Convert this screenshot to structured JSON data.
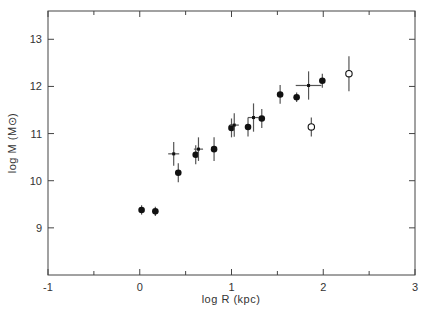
{
  "chart_data": {
    "type": "scatter",
    "title": "",
    "xlabel": "log R (kpc)",
    "ylabel": "log M (M⊙)",
    "ylabel_main": "log M",
    "ylabel_unit": "(M⊙)",
    "xlim": [
      -1,
      3
    ],
    "ylim": [
      8,
      13.6
    ],
    "x_ticks": [
      -1,
      0,
      1,
      2,
      3
    ],
    "x_tick_labels": [
      "-1",
      "0",
      "1",
      "2",
      "3"
    ],
    "x_minor_ticks": [
      -0.5,
      0.5,
      1.5,
      2.5
    ],
    "y_ticks": [
      9,
      10,
      11,
      12,
      13
    ],
    "y_tick_labels": [
      "9",
      "10",
      "11",
      "12",
      "13"
    ],
    "grid": false,
    "legend": null,
    "series": [
      {
        "name": "filled circles",
        "marker": "filled-circle",
        "points": [
          {
            "x": 0.02,
            "y": 9.38,
            "yerr": 0.1
          },
          {
            "x": 0.17,
            "y": 9.35,
            "yerr": 0.1
          },
          {
            "x": 0.42,
            "y": 10.17,
            "yerr": 0.2
          },
          {
            "x": 0.61,
            "y": 10.55,
            "yerr": 0.2
          },
          {
            "x": 0.81,
            "y": 10.67,
            "yerr": 0.25
          },
          {
            "x": 1.0,
            "y": 11.12,
            "yerr": 0.2
          },
          {
            "x": 1.18,
            "y": 11.14,
            "yerr": 0.2
          },
          {
            "x": 1.33,
            "y": 11.32,
            "yerr": 0.2
          },
          {
            "x": 1.53,
            "y": 11.83,
            "yerr": 0.2
          },
          {
            "x": 1.71,
            "y": 11.77,
            "yerr": 0.1
          },
          {
            "x": 1.99,
            "y": 12.12,
            "yerr": 0.15
          }
        ]
      },
      {
        "name": "crosses",
        "marker": "cross",
        "points": [
          {
            "x": 0.37,
            "y": 10.57,
            "yerr": 0.25,
            "xerr": 0.06
          },
          {
            "x": 0.64,
            "y": 10.67,
            "yerr": 0.25,
            "xerr": 0.05
          },
          {
            "x": 1.03,
            "y": 11.18,
            "yerr": 0.25,
            "xerr": 0.05
          },
          {
            "x": 1.24,
            "y": 11.34,
            "yerr": 0.3,
            "xerr": 0.06
          },
          {
            "x": 1.84,
            "y": 12.02,
            "yerr": 0.3,
            "xerr": 0.14
          }
        ]
      },
      {
        "name": "open circles",
        "marker": "open-circle",
        "points": [
          {
            "x": 1.87,
            "y": 11.14,
            "yerr": 0.2
          },
          {
            "x": 2.28,
            "y": 12.27,
            "yerr": 0.37
          }
        ]
      }
    ]
  },
  "colors": {
    "axis": "#444444",
    "marker": "#111111",
    "errorbar": "#555555",
    "background": "#ffffff"
  }
}
